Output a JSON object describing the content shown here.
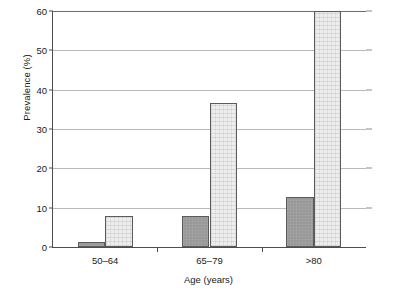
{
  "chart_data": {
    "type": "bar",
    "title": "",
    "xlabel": "Age (years)",
    "ylabel": "Prevalence (%)",
    "categories": [
      "50–64",
      "65–79",
      ">80"
    ],
    "series": [
      {
        "name": "series-1-dark",
        "color": "#989898",
        "values": [
          1.2,
          8.0,
          12.6
        ]
      },
      {
        "name": "series-2-light",
        "color": "#ededed",
        "values": [
          7.8,
          36.7,
          60.0
        ]
      }
    ],
    "ylim": [
      0,
      60
    ],
    "yticks": [
      0,
      10,
      20,
      30,
      40,
      50,
      60
    ],
    "ytick_labels": [
      "0",
      "10",
      "20",
      "30",
      "40",
      "50",
      "60"
    ],
    "grid": true,
    "grid_axis": "y",
    "legend": "none",
    "legend_position": "none",
    "annotations": []
  },
  "axes": {
    "y_title": "Prevalence (%)",
    "x_title": "Age (years)"
  },
  "colors": {
    "axis": "#4d4d4d",
    "gridline": "#b9b9b9",
    "bar_dark": "#989898",
    "bar_light": "#ededed",
    "bar_outline": "#5b5b5b",
    "text": "#1a1a1a",
    "background": "#ffffff"
  }
}
